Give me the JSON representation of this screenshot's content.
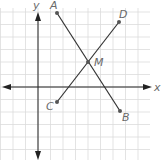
{
  "diagram": {
    "type": "coordinate-plane-segments",
    "axes": {
      "x_label": "x",
      "y_label": "y",
      "origin_px": [
        38,
        87
      ]
    },
    "grid": {
      "spacing_px": 12.5,
      "color": "#d9d9d9"
    },
    "points": [
      {
        "name": "A",
        "px": [
          57,
          13
        ]
      },
      {
        "name": "B",
        "px": [
          120,
          111
        ]
      },
      {
        "name": "C",
        "px": [
          57,
          102
        ]
      },
      {
        "name": "D",
        "px": [
          119,
          22
        ]
      },
      {
        "name": "M",
        "px": [
          88,
          62
        ]
      }
    ],
    "segments": [
      {
        "from": "A",
        "to": "B"
      },
      {
        "from": "C",
        "to": "D"
      }
    ],
    "colors": {
      "line": "#333333",
      "point": "#555555",
      "label": "#6a6a6a",
      "axis": "#222222"
    }
  }
}
